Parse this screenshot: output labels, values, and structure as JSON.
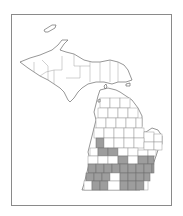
{
  "map": {
    "region": "Michigan",
    "subdivision": "counties",
    "colors": {
      "shaded": "#9d9d9d",
      "unshaded": "#ffffff",
      "border": "#6a6a6a",
      "frame": "#8a8a8a"
    },
    "shaded_counties_grid": [
      {
        "col": 0,
        "row": 0
      },
      {
        "col": 1,
        "row": 1
      },
      {
        "col": 2,
        "row": 1
      },
      {
        "col": 4,
        "row": 2
      },
      {
        "col": 6,
        "row": 2
      },
      {
        "col": 7,
        "row": 2
      },
      {
        "col": 0,
        "row": 3
      },
      {
        "col": 1,
        "row": 3
      },
      {
        "col": 2,
        "row": 3
      },
      {
        "col": 3,
        "row": 3
      },
      {
        "col": 4,
        "row": 3
      },
      {
        "col": 5,
        "row": 3
      },
      {
        "col": 6,
        "row": 3
      },
      {
        "col": 7,
        "row": 3
      },
      {
        "col": 8,
        "row": 3
      },
      {
        "col": 0,
        "row": 4
      },
      {
        "col": 1,
        "row": 4
      },
      {
        "col": 2,
        "row": 4
      },
      {
        "col": 4,
        "row": 4
      },
      {
        "col": 5,
        "row": 4
      },
      {
        "col": 6,
        "row": 4
      },
      {
        "col": 7,
        "row": 4
      },
      {
        "col": 0,
        "row": 5
      },
      {
        "col": 1,
        "row": 5
      },
      {
        "col": 4,
        "row": 5
      },
      {
        "col": 5,
        "row": 5
      },
      {
        "col": 6,
        "row": 5
      },
      {
        "col": 7,
        "row": 5
      }
    ]
  }
}
